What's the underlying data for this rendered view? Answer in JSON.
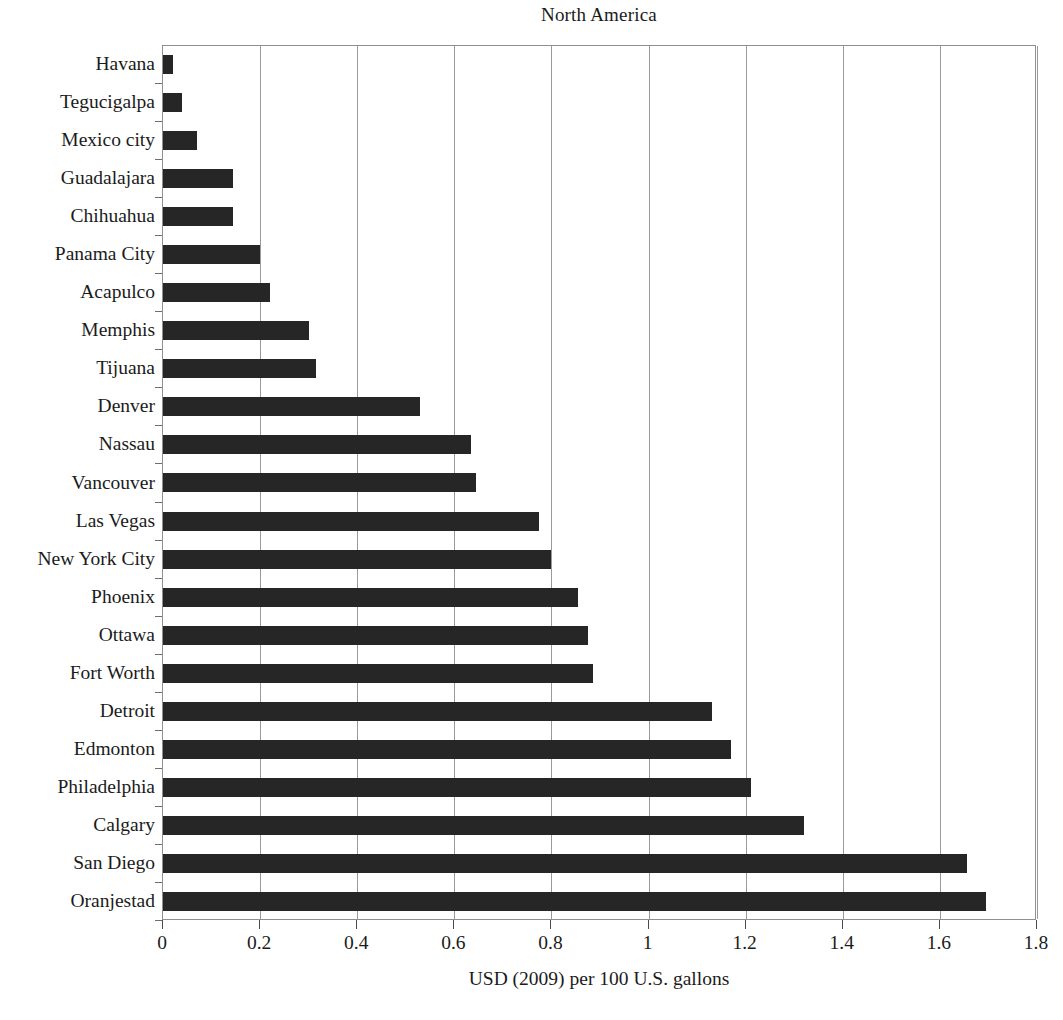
{
  "chart_data": {
    "type": "bar",
    "orientation": "horizontal",
    "title": "North America",
    "xlabel": "USD (2009) per 100 U.S. gallons",
    "ylabel": "",
    "xlim": [
      0,
      1.8
    ],
    "xticks": [
      "0",
      "0.2",
      "0.4",
      "0.6",
      "0.8",
      "1",
      "1.2",
      "1.4",
      "1.6",
      "1.8"
    ],
    "xtick_values": [
      0,
      0.2,
      0.4,
      0.6,
      0.8,
      1,
      1.2,
      1.4,
      1.6,
      1.8
    ],
    "grid": "vertical",
    "legend": "none",
    "bar_color": "#262626",
    "categories": [
      "Havana",
      "Tegucigalpa",
      "Mexico city",
      "Guadalajara",
      "Chihuahua",
      "Panama City",
      "Acapulco",
      "Memphis",
      "Tijuana",
      "Denver",
      "Nassau",
      "Vancouver",
      "Las Vegas",
      "New York City",
      "Phoenix",
      "Ottawa",
      "Fort Worth",
      "Detroit",
      "Edmonton",
      "Philadelphia",
      "Calgary",
      "San Diego",
      "Oranjestad"
    ],
    "values": [
      0.02,
      0.04,
      0.07,
      0.145,
      0.145,
      0.2,
      0.22,
      0.3,
      0.315,
      0.53,
      0.635,
      0.645,
      0.775,
      0.8,
      0.855,
      0.875,
      0.885,
      1.13,
      1.17,
      1.21,
      1.32,
      1.655,
      1.695
    ]
  }
}
